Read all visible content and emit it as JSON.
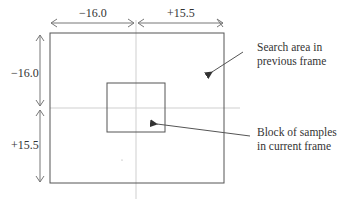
{
  "diagram": {
    "dimensions": {
      "horizontal_left": "−16.0",
      "horizontal_right": "+15.5",
      "vertical_top": "−16.0",
      "vertical_bottom": "+15.5"
    },
    "annotations": {
      "search_area": {
        "line1": "Search area in",
        "line2": "previous frame"
      },
      "block": {
        "line1": "Block of samples",
        "line2": "in current frame"
      }
    },
    "colors": {
      "box_stroke": "#555555",
      "center_line": "#cccccc",
      "arrow": "#555555",
      "text": "#333333"
    }
  }
}
